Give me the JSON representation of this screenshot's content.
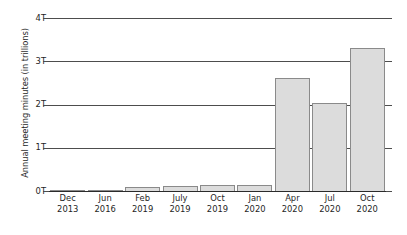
{
  "chart_data": {
    "type": "bar",
    "title": "",
    "subtitle": "",
    "xlabel": "",
    "ylabel": "Annual meeting minutes (in trillions)",
    "categories": [
      "Dec 2013",
      "Jun 2016",
      "Feb 2019",
      "July 2019",
      "Oct 2019",
      "Jan 2020",
      "Apr 2020",
      "Jul 2020",
      "Oct 2020"
    ],
    "category_months": [
      "Dec",
      "Jun",
      "Feb",
      "July",
      "Oct",
      "Jan",
      "Apr",
      "Jul",
      "Oct"
    ],
    "category_years": [
      "2013",
      "2016",
      "2019",
      "2019",
      "2019",
      "2020",
      "2020",
      "2020",
      "2020"
    ],
    "values": [
      0.01,
      0.02,
      0.1,
      0.11,
      0.13,
      0.13,
      2.61,
      2.03,
      3.31
    ],
    "value_unit": "trillions",
    "ylim": [
      0,
      4
    ],
    "yticks": [
      0,
      1,
      2,
      3,
      4
    ],
    "ytick_labels": [
      "0T",
      "1T",
      "2T",
      "3T",
      "4T"
    ],
    "grid": true,
    "legend": false,
    "legend_position": "none",
    "bar_fill_color": "#dcdcdc",
    "bar_border_color": "#8a8a8a",
    "gridline_color": "#4d4d4d",
    "axis_color": "#2b2b2b",
    "text_color": "#1f1f1f",
    "background_color": "#ffffff"
  }
}
